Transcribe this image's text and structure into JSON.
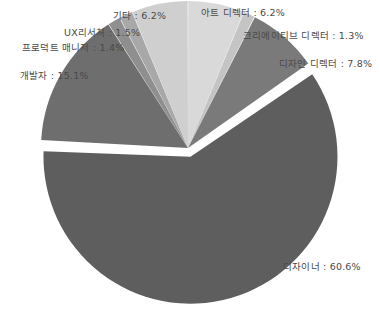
{
  "chart_data": {
    "type": "pie",
    "title": "",
    "subtitle": "",
    "xlabel": "",
    "ylabel": "",
    "grid": false,
    "legend_position": "outside-labels",
    "unit": "%",
    "label_separator": " : ",
    "start_angle_deg": 0,
    "direction": "clockwise",
    "exploded_slice": "디자이너",
    "categories": [
      "아트 디렉터",
      "크리에이티브 디렉터",
      "디자인 디렉터",
      "디자이너",
      "개발자",
      "프로덕트 매니저",
      "UX리서처",
      "기타"
    ],
    "values": [
      6.2,
      1.3,
      7.8,
      60.6,
      15.1,
      1.4,
      1.5,
      6.2
    ],
    "colors": [
      "#d9d9d9",
      "#c4c4c4",
      "#7a7a7a",
      "#5e5e5e",
      "#6e6e6e",
      "#8f8f8f",
      "#a8a8a8",
      "#cfcfcf"
    ],
    "slices": [
      {
        "label": "아트 디렉터",
        "value": 6.2,
        "text": "아트 디렉터 : 6.2%",
        "color": "#d9d9d9"
      },
      {
        "label": "크리에이티브 디렉터",
        "value": 1.3,
        "text": "크리에이티브 디렉터 : 1.3%",
        "color": "#c4c4c4"
      },
      {
        "label": "디자인 디렉터",
        "value": 7.8,
        "text": "디자인 디렉터 : 7.8%",
        "color": "#7a7a7a"
      },
      {
        "label": "디자이너",
        "value": 60.6,
        "text": "디자이너 : 60.6%",
        "color": "#5e5e5e"
      },
      {
        "label": "개발자",
        "value": 15.1,
        "text": "개발자 : 15.1%",
        "color": "#6e6e6e"
      },
      {
        "label": "프로덕트 매니저",
        "value": 1.4,
        "text": "프로덕트 매니저 : 1.4%",
        "color": "#8f8f8f"
      },
      {
        "label": "UX리서처",
        "value": 1.5,
        "text": "UX리서처 : 1.5%",
        "color": "#a8a8a8"
      },
      {
        "label": "기타",
        "value": 6.2,
        "text": "기타 : 6.2%",
        "color": "#cfcfcf"
      }
    ]
  },
  "labels": {
    "art_director": "아트 디렉터 : 6.2%",
    "creative_director": "크리에이티브 디렉터 : 1.3%",
    "design_director": "디자인 디렉터 : 7.8%",
    "designer": "디자이너 : 60.6%",
    "developer": "개발자 : 15.1%",
    "product_manager": "프로덕트 매니저 : 1.4%",
    "ux_researcher": "UX리서처 : 1.5%",
    "etc": "기타 : 6.2%"
  }
}
